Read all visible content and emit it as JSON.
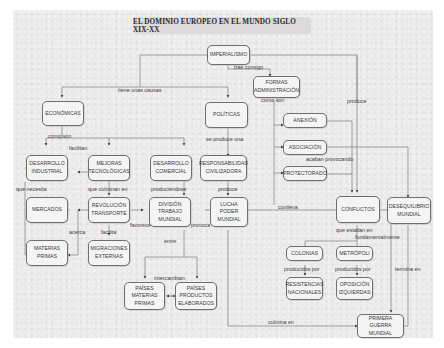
{
  "title": "EL DOMINIO EUROPEO EN EL MUNDO SIGLO XIX-XX",
  "nodes": {
    "imperialismo": "IMPERIALISMO",
    "formas": "FORMAS\nADMINISTRACIÓN",
    "economicas": "ECONÓMICAS",
    "politicas": "POLÍTICAS",
    "anexion": "ANEXIÓN",
    "asociacion": "ASOCIACIÓN",
    "protectorado": "PROTECTORADO",
    "desarrollo_industrial": "DESARROLLO\nINDUSTRIAL",
    "mejoras": "MEJORAS\nTECNOLÓGICAS",
    "desarrollo_comercial": "DESARROLLO\nCOMERCIAL",
    "responsabilidad": "RESPONSABILIDAD\nCIVILIZADORA",
    "mercados": "MERCADOS",
    "revolucion": "REVOLUCIÓN\nTRANSPORTE",
    "division": "DIVISIÓN\nTRABAJO\nMUNDIAL",
    "lucha": "LUCHA\nPODER\nMUNDIAL",
    "conflictos": "CONFLICTOS",
    "desequilibrio": "DESEQUILIBRIO\nMUNDIAL",
    "materias": "MATERIAS\nPRIMAS",
    "migraciones": "MIGRACIONES\nEXTERNAS",
    "colonias": "COLONIAS",
    "metropoli": "METRÓPOLI",
    "paises_mp": "PAÍSES\nMATERIAS\nPRIMAS",
    "paises_pe": "PAÍSES\nPRODUCTOS\nELABORADOS",
    "resistencias": "RESISTENCIAS\nNACIONALES",
    "oposicion": "OPOSICIÓN\nIZQUIERDAS",
    "primera": "PRIMERA\nGUERRA MUNDIAL"
  },
  "labels": {
    "trae_consigo": "trae consigo",
    "tiene_causas": "tiene unas causas",
    "produce": "produce",
    "como_son_form": "como son",
    "como_son_eco": "como son",
    "se_produce_una": "se produce una",
    "facilitan": "facilitan",
    "acaban_provocando": "acaban provocando",
    "que_necesita": "que necesita",
    "que_culminan_en": "que culminan en",
    "produciendose": "produciéndose",
    "produce2": "produce",
    "conlleva": "conlleva",
    "favorece": "favorece",
    "provoca": "provoca",
    "acerca": "acerca",
    "facilita": "facilita",
    "entre": "entre",
    "que_estallan_en": "que estallan en",
    "fundamentalmente": "fundamentalmente",
    "producidos_por_1": "producidos por",
    "producidos_por_2": "producidos por",
    "termina_en": "termina en",
    "intercambian": "intercambian",
    "culmina_en": "culmina en"
  }
}
